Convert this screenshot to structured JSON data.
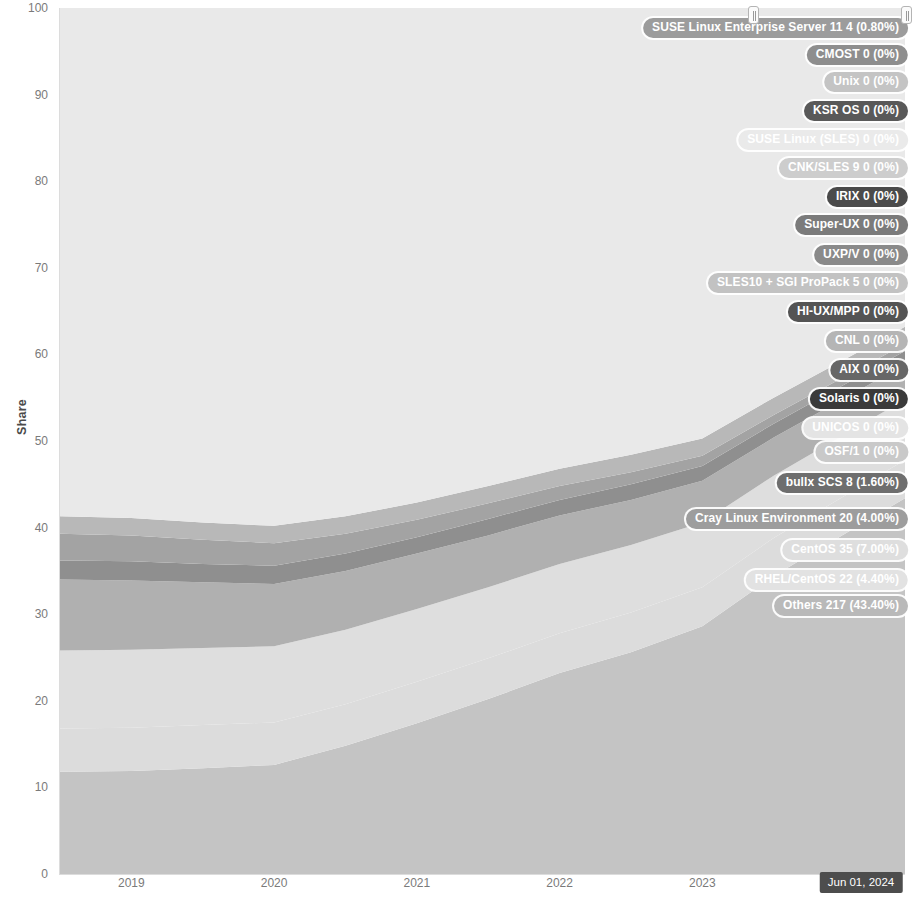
{
  "chart_data": {
    "type": "area",
    "title": "",
    "xlabel": "",
    "ylabel": "Share",
    "ylim": [
      0,
      100
    ],
    "y_ticks": [
      "100",
      "90",
      "80",
      "70",
      "60",
      "50",
      "40",
      "30",
      "20",
      "10",
      "0"
    ],
    "x_ticks": [
      "2019",
      "2020",
      "2021",
      "2022",
      "2023"
    ],
    "current_x_label": "Jun 01, 2024",
    "grid": false,
    "legend_position": "inline-right",
    "stacked": true,
    "x": [
      2018.5,
      2019,
      2019.5,
      2020,
      2020.5,
      2021,
      2021.5,
      2022,
      2022.5,
      2023,
      2023.5,
      2024.42
    ],
    "series": [
      {
        "name": "Others",
        "count": "217",
        "percent": "43.40%",
        "label": "Others 217 (43.40%)",
        "color": "#c4c4c4",
        "label_color": "#b9b9b9",
        "label_y": 31.0,
        "values": [
          11.8,
          11.9,
          12.2,
          12.6,
          14.8,
          17.4,
          20.2,
          23.2,
          25.6,
          28.6,
          34.4,
          43.4
        ]
      },
      {
        "name": "RHEL/CentOS",
        "count": "22",
        "percent": "4.40%",
        "label": "RHEL/CentOS 22 (4.40%)",
        "color": "#dcdcdc",
        "label_color": "#e2e2e2",
        "label_y": 34.0,
        "values": [
          5.0,
          5.0,
          5.0,
          4.9,
          4.8,
          4.8,
          4.7,
          4.6,
          4.6,
          4.5,
          4.4,
          4.4
        ]
      },
      {
        "name": "CentOS",
        "count": "35",
        "percent": "7.00%",
        "label": "CentOS 35 (7.00%)",
        "color": "#dedede",
        "label_color": "#dedede",
        "label_y": 37.4,
        "values": [
          9.0,
          9.0,
          8.9,
          8.8,
          8.6,
          8.4,
          8.2,
          8.0,
          7.8,
          7.5,
          7.2,
          7.0
        ]
      },
      {
        "name": "Cray Linux Environment",
        "count": "20",
        "percent": "4.00%",
        "label": "Cray Linux Environment 20 (4.00%)",
        "color": "#b0b0b0",
        "label_color": "#9d9d9d",
        "label_y": 41.0,
        "values": [
          8.2,
          8.0,
          7.6,
          7.2,
          6.8,
          6.4,
          6.0,
          5.6,
          5.2,
          4.8,
          4.4,
          4.0
        ]
      },
      {
        "name": "bullx SCS",
        "count": "8",
        "percent": "1.60%",
        "label": "bullx SCS 8 (1.60%)",
        "color": "#8f8f8f",
        "label_color": "#6e6e6e",
        "label_y": 45.2,
        "values": [
          2.2,
          2.2,
          2.1,
          2.1,
          2.0,
          1.9,
          1.9,
          1.8,
          1.8,
          1.7,
          1.6,
          1.6
        ]
      },
      {
        "name": "OSF/1",
        "count": "0",
        "percent": "0%",
        "label": "OSF/1 0 (0%)",
        "color": "#d2d2d2",
        "label_color": "#c9c9c9",
        "label_y": 48.7,
        "values": [
          0,
          0,
          0,
          0,
          0,
          0,
          0,
          0,
          0,
          0,
          0,
          0
        ]
      },
      {
        "name": "UNICOS",
        "count": "0",
        "percent": "0%",
        "label": "UNICOS 0 (0%)",
        "color": "#e4e4e4",
        "label_color": "#e4e4e4",
        "label_y": 51.5,
        "values": [
          0,
          0,
          0,
          0,
          0,
          0,
          0,
          0,
          0,
          0,
          0,
          0
        ]
      },
      {
        "name": "Solaris",
        "count": "0",
        "percent": "0%",
        "label": "Solaris 0 (0%)",
        "color": "#3f3f3f",
        "label_color": "#3a3a3a",
        "label_y": 54.8,
        "values": [
          0,
          0,
          0,
          0,
          0,
          0,
          0,
          0,
          0,
          0,
          0,
          0
        ]
      },
      {
        "name": "AIX",
        "count": "0",
        "percent": "0%",
        "label": "AIX 0 (0%)",
        "color": "#6a6a6a",
        "label_color": "#676767",
        "label_y": 58.2,
        "values": [
          0,
          0,
          0,
          0,
          0,
          0,
          0,
          0,
          0,
          0,
          0,
          0
        ]
      },
      {
        "name": "CNL",
        "count": "0",
        "percent": "0%",
        "label": "CNL 0 (0%)",
        "color": "#bdbdbd",
        "label_color": "#b5b5b5",
        "label_y": 61.5,
        "values": [
          0,
          0,
          0,
          0,
          0,
          0,
          0,
          0,
          0,
          0,
          0,
          0
        ]
      },
      {
        "name": "HI-UX/MPP",
        "count": "0",
        "percent": "0%",
        "label": "HI-UX/MPP 0 (0%)",
        "color": "#585858",
        "label_color": "#545454",
        "label_y": 64.9,
        "values": [
          0,
          0,
          0,
          0,
          0,
          0,
          0,
          0,
          0,
          0,
          0,
          0
        ]
      },
      {
        "name": "SLES10 + SGI ProPack 5",
        "count": "0",
        "percent": "0%",
        "label": "SLES10 + SGI ProPack 5 0 (0%)",
        "color": "#c6c6c6",
        "label_color": "#c2c2c2",
        "label_y": 68.3,
        "values": [
          0,
          0,
          0,
          0,
          0,
          0,
          0,
          0,
          0,
          0,
          0,
          0
        ]
      },
      {
        "name": "UXP/V",
        "count": "0",
        "percent": "0%",
        "label": "UXP/V 0 (0%)",
        "color": "#8a8a8a",
        "label_color": "#8a8a8a",
        "label_y": 71.5,
        "values": [
          0,
          0,
          0,
          0,
          0,
          0,
          0,
          0,
          0,
          0,
          0,
          0
        ]
      },
      {
        "name": "Super-UX",
        "count": "0",
        "percent": "0%",
        "label": "Super-UX 0 (0%)",
        "color": "#7e7e7e",
        "label_color": "#7b7b7b",
        "label_y": 74.9,
        "values": [
          0,
          0,
          0,
          0,
          0,
          0,
          0,
          0,
          0,
          0,
          0,
          0
        ]
      },
      {
        "name": "IRIX",
        "count": "0",
        "percent": "0%",
        "label": "IRIX 0 (0%)",
        "color": "#4e4e4e",
        "label_color": "#4b4b4b",
        "label_y": 78.2,
        "values": [
          0,
          0,
          0,
          0,
          0,
          0,
          0,
          0,
          0,
          0,
          0,
          0
        ]
      },
      {
        "name": "CNK/SLES 9",
        "count": "0",
        "percent": "0%",
        "label": "CNK/SLES 9 0 (0%)",
        "color": "#cfcfcf",
        "label_color": "#cdcdcd",
        "label_y": 81.5,
        "values": [
          0,
          0,
          0,
          0,
          0,
          0,
          0,
          0,
          0,
          0,
          0,
          0
        ]
      },
      {
        "name": "SUSE Linux",
        "count": "0",
        "percent": "0%",
        "label": "SUSE Linux (SLES) 0 (0%)",
        "color": "#e8e8e8",
        "label_color": "#eaeaea",
        "label_y": 84.8,
        "values": [
          0,
          0,
          0,
          0,
          0,
          0,
          0,
          0,
          0,
          0,
          0,
          0
        ]
      },
      {
        "name": "KSR OS",
        "count": "0",
        "percent": "0%",
        "label": "KSR OS 0 (0%)",
        "color": "#5d5d5d",
        "label_color": "#595959",
        "label_y": 88.1,
        "values": [
          0,
          0,
          0,
          0,
          0,
          0,
          0,
          0,
          0,
          0,
          0,
          0
        ]
      },
      {
        "name": "Unix",
        "count": "0",
        "percent": "0%",
        "label": "Unix 0 (0%)",
        "color": "#cacaca",
        "label_color": "#c4c4c4",
        "label_y": 91.4,
        "values": [
          0,
          0,
          0,
          0,
          0,
          0,
          0,
          0,
          0,
          0,
          0,
          0
        ]
      },
      {
        "name": "CMOST",
        "count": "0",
        "percent": "0%",
        "label": "CMOST 0 (0%)",
        "color": "#9b9b9b",
        "label_color": "#8e8e8e",
        "label_y": 94.6,
        "values": [
          0,
          0,
          0,
          0,
          0,
          0,
          0,
          0,
          0,
          0,
          0,
          0
        ]
      },
      {
        "name": "SUSE Linux Enterprise Server 11",
        "count": "4",
        "percent": "0.80%",
        "label": "SUSE Linux Enterprise Server 11 4 (0.80%)",
        "color": "#a3a3a3",
        "label_color": "#9c9c9c",
        "label_y": 97.7,
        "values": [
          3.1,
          3.0,
          2.8,
          2.6,
          2.3,
          2.0,
          1.8,
          1.6,
          1.4,
          1.2,
          1.0,
          0.8
        ]
      },
      {
        "name": "Top band filler",
        "count": "",
        "percent": "",
        "label": "",
        "color": "#b8b8b8",
        "label_color": "#b8b8b8",
        "label_y": null,
        "values": [
          2.0,
          2.0,
          2.0,
          2.0,
          2.0,
          2.0,
          2.0,
          2.0,
          2.0,
          2.0,
          2.0,
          2.0
        ]
      },
      {
        "name": "Linux",
        "count": "",
        "percent": "",
        "label": "",
        "color": "#e9e9e9",
        "label_color": "#e9e9e9",
        "label_y": null,
        "values": [
          58.7,
          58.9,
          59.4,
          59.8,
          58.7,
          57.1,
          55.2,
          53.2,
          51.6,
          49.7,
          45.0,
          36.8
        ]
      }
    ]
  },
  "controls": {
    "left_handle_name": "range-slider-left-handle",
    "right_handle_name": "range-slider-right-handle"
  }
}
